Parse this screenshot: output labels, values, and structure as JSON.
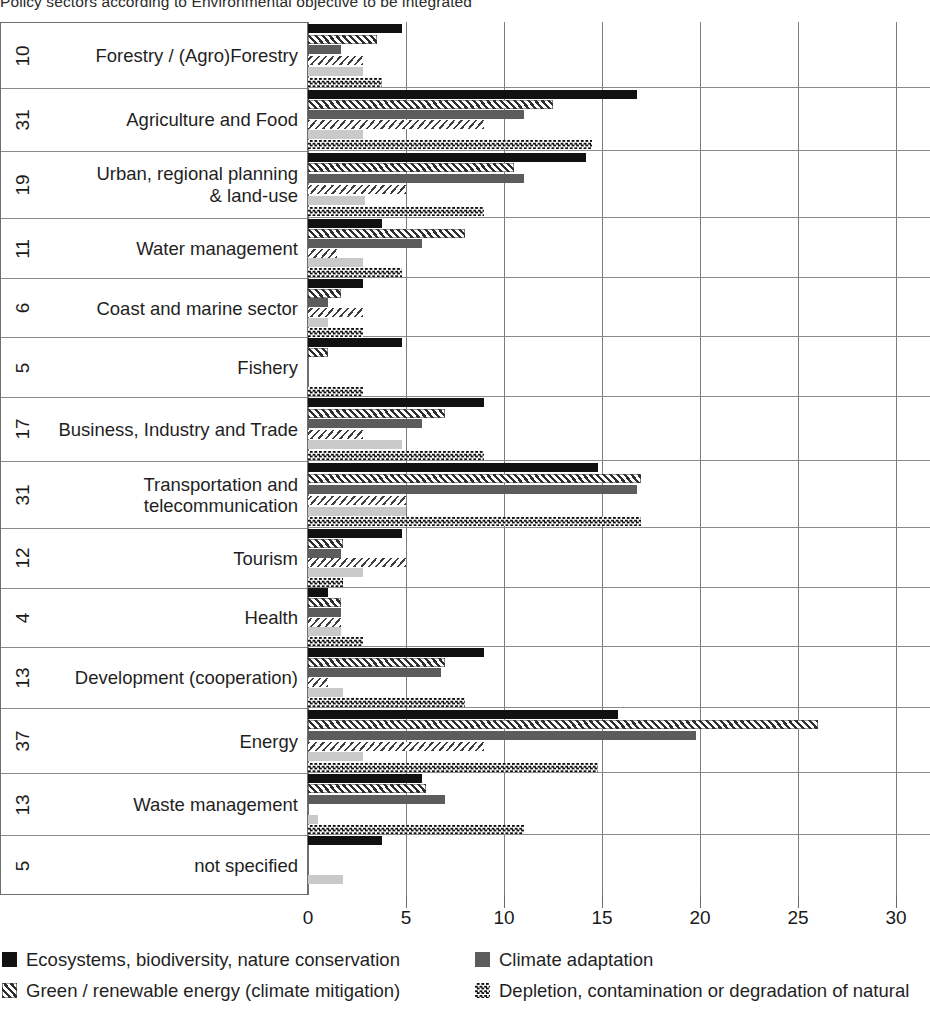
{
  "chart_data": {
    "type": "bar",
    "orientation": "horizontal",
    "title": "Policy sectors according to Environmental objective to be integrated",
    "xlabel": "",
    "ylabel": "",
    "xlim": [
      0,
      30
    ],
    "xticks": [
      0,
      5,
      10,
      15,
      20,
      25,
      30
    ],
    "xtick_labels": [
      "0",
      "5",
      "10",
      "15",
      "20",
      "25",
      "30"
    ],
    "grid": "vertical",
    "legend_position": "bottom",
    "legend_note": "legend is cropped at the bottom edge of the screenshot; last entry text is cut off",
    "categories": [
      "Forestry / (Agro)Forestry",
      "Agriculture and Food",
      "Urban, regional planning & land-use",
      "Water management",
      "Coast and marine sector",
      "Fishery",
      "Business, Industry and Trade",
      "Transportation and telecommunication",
      "Tourism",
      "Health",
      "Development (cooperation)",
      "Energy",
      "Waste management",
      "not specified"
    ],
    "category_counts": [
      10,
      31,
      19,
      11,
      6,
      5,
      17,
      31,
      12,
      4,
      13,
      37,
      13,
      5
    ],
    "series": [
      {
        "name": "Ecosystems, biodiversity, nature conservation",
        "color": "#111111",
        "pattern": "solid",
        "values": [
          4.8,
          16.8,
          14.2,
          3.8,
          2.8,
          4.8,
          9.0,
          14.8,
          4.8,
          1.0,
          9.0,
          15.8,
          5.8,
          3.8
        ]
      },
      {
        "name": "Green / renewable energy (climate mitigation)",
        "color": "#2e2e2e",
        "pattern": "diagonal-hatch-up",
        "values": [
          3.5,
          12.5,
          10.5,
          8.0,
          1.7,
          1.0,
          7.0,
          17.0,
          1.8,
          1.7,
          7.0,
          26.0,
          6.0,
          0.0
        ]
      },
      {
        "name": "Climate adaptation",
        "color": "#5c5c5c",
        "pattern": "solid",
        "values": [
          1.7,
          11.0,
          11.0,
          5.8,
          1.0,
          0.0,
          5.8,
          16.8,
          1.7,
          1.7,
          6.8,
          19.8,
          7.0,
          0.0
        ]
      },
      {
        "name": "Green / renewable energy (climate mitigation) - light",
        "color": "#3d3d3d",
        "pattern": "diagonal-hatch-down",
        "values": [
          2.8,
          9.0,
          5.0,
          1.5,
          2.8,
          0.0,
          2.8,
          5.0,
          5.0,
          1.7,
          1.0,
          9.0,
          0.0,
          0.0
        ]
      },
      {
        "name": "Climate adaptation - light",
        "color": "#c9c9c9",
        "pattern": "solid",
        "values": [
          2.8,
          2.8,
          2.9,
          2.8,
          1.0,
          0.0,
          4.8,
          5.0,
          2.8,
          1.7,
          1.8,
          2.8,
          0.5,
          1.8
        ]
      },
      {
        "name": "Depletion, contamination or degradation of natural",
        "color": "#0d0d0d",
        "pattern": "checkerboard",
        "values": [
          3.8,
          14.5,
          9.0,
          4.8,
          2.8,
          2.8,
          9.0,
          17.0,
          1.8,
          2.8,
          8.0,
          14.8,
          11.0,
          0.0
        ]
      }
    ],
    "legend": [
      {
        "label": "Ecosystems, biodiversity, nature conservation",
        "swatch": "solid-black"
      },
      {
        "label": "Green / renewable energy (climate mitigation)",
        "swatch": "diagonal-hatch"
      },
      {
        "label": "Climate adaptation",
        "swatch": "solid-gray"
      },
      {
        "label": "Depletion, contamination or degradation of natural",
        "swatch": "checkerboard"
      }
    ]
  }
}
